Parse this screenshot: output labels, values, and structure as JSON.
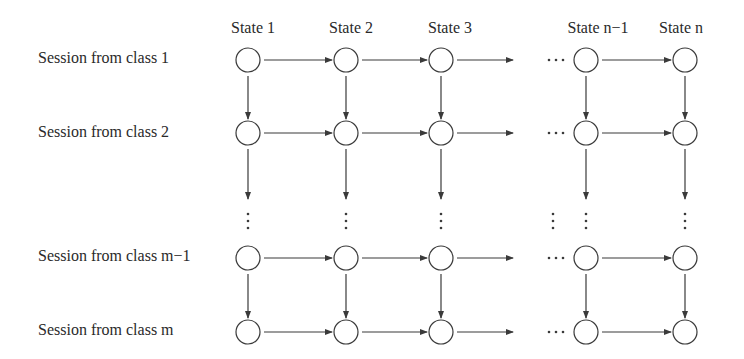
{
  "diagram": {
    "column_labels": [
      "State 1",
      "State 2",
      "State 3",
      "State n−1",
      "State n"
    ],
    "row_labels": [
      "Session from class 1",
      "Session from class 2",
      "Session from class m−1",
      "Session from class m"
    ],
    "ellipsis_horizontal": "⋯",
    "ellipsis_vertical": "⋮",
    "colors": {
      "stroke": "#3a3a3a",
      "text": "#2a2a2a",
      "background": "#ffffff"
    }
  }
}
